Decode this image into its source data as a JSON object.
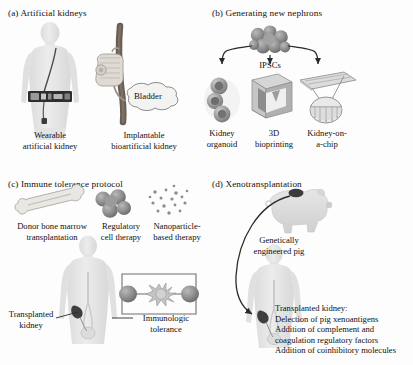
{
  "figure": {
    "width": 413,
    "height": 365,
    "background": "#fdfdfd",
    "ink": "#111111",
    "silhouette_color": "#e2e2e2",
    "device_color": "#3a3a3a",
    "cell_color": "#8e8e8e"
  },
  "panels": {
    "a": {
      "title": "(a) Artificial kidneys",
      "captions": [
        {
          "line1": "Wearable",
          "line2": "artificial kidney"
        },
        {
          "line1": "Implantable",
          "line2": "bioartificial kidney"
        }
      ],
      "callout": "Bladder"
    },
    "b": {
      "title": "(b) Generating new nephrons",
      "source_label": "IPSCs",
      "captions": [
        {
          "line1": "Kidney",
          "line2": "organoid"
        },
        {
          "line1": "3D",
          "line2": "bioprinting"
        },
        {
          "line1": "Kidney-on-",
          "line2": "a-chip"
        }
      ]
    },
    "c": {
      "title": "(c) Immune tolerance protocol",
      "captions": [
        {
          "line1": "Donor bone marrow",
          "line2": "transplantation"
        },
        {
          "line1": "Regulatory",
          "line2": "cell therapy"
        },
        {
          "line1": "Nanoparticle-",
          "line2": "based therapy"
        }
      ],
      "annotations": [
        {
          "line1": "Transplanted",
          "line2": "kidney"
        },
        {
          "line1": "Immunologic",
          "line2": "tolerance"
        }
      ]
    },
    "d": {
      "title": "(d) Xenotransplantation",
      "source_caption": {
        "line1": "Genetically",
        "line2": "engineered pig"
      },
      "notes": [
        "Transplanted kidney:",
        "Delection of pig xenoantigens",
        "Addition of complement and",
        "coagulation regulatory factors",
        "Addition of coinhibitory molecules"
      ]
    }
  }
}
